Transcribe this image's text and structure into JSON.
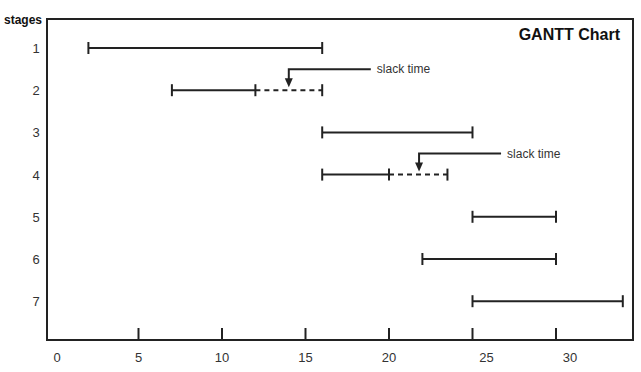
{
  "chart_data": {
    "type": "gantt",
    "title": "GANTT Chart",
    "xlabel": "",
    "ylabel": "stages",
    "xlim": [
      0,
      34
    ],
    "xticks": [
      0,
      5,
      10,
      15,
      20,
      25,
      30
    ],
    "xtick_labels": [
      "0",
      "5",
      "10",
      "15",
      "20",
      "25",
      "30"
    ],
    "grid": false,
    "stages": [
      {
        "label": "1",
        "start": 2,
        "end": 16,
        "slack_end": null
      },
      {
        "label": "2",
        "start": 7,
        "end": 12,
        "slack_end": 16
      },
      {
        "label": "3",
        "start": 16,
        "end": 25,
        "slack_end": null
      },
      {
        "label": "4",
        "start": 16,
        "end": 20,
        "slack_end": 23.5
      },
      {
        "label": "5",
        "start": 25,
        "end": 30,
        "slack_end": null
      },
      {
        "label": "6",
        "start": 22,
        "end": 30,
        "slack_end": null
      },
      {
        "label": "7",
        "start": 25,
        "end": 34,
        "slack_end": null
      }
    ],
    "annotations": [
      {
        "text": "slack time",
        "stage": "2",
        "points_to_x": 14
      },
      {
        "text": "slack time",
        "stage": "4",
        "points_to_x": 21.8
      }
    ]
  }
}
